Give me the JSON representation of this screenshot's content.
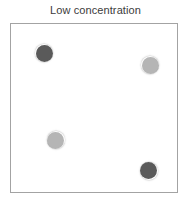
{
  "figure": {
    "title": "Low concentration",
    "background_color": "#ffffff"
  },
  "box": {
    "label": "particle-container",
    "border_color": "#a3a3a3",
    "fill_color": "#ffffff",
    "x": 10,
    "y": 23,
    "width": 168,
    "height": 170
  },
  "legend_colors": {
    "dark_particle": "#5a5a5a",
    "light_particle": "#b5b5b5"
  },
  "chart_data": {
    "type": "scatter",
    "title": "Low concentration",
    "subtitle": "",
    "xlabel": "",
    "ylabel": "",
    "xlim": [
      0,
      168
    ],
    "ylim": [
      0,
      170
    ],
    "grid": false,
    "legend": "none",
    "particle_count": 4,
    "particle_diameter": 17,
    "series": [
      {
        "name": "dark particle",
        "color": "#5a5a5a",
        "points": [
          {
            "x": 34,
            "y": 30
          },
          {
            "x": 138,
            "y": 148
          }
        ]
      },
      {
        "name": "light particle",
        "color": "#b5b5b5",
        "points": [
          {
            "x": 140,
            "y": 42
          },
          {
            "x": 45,
            "y": 117
          }
        ]
      }
    ],
    "particles": [
      {
        "id": "particle-1",
        "shade": "dark",
        "color": "#5a5a5a",
        "cx": 44.0,
        "cy": 53.0,
        "d": 17
      },
      {
        "id": "particle-2",
        "shade": "light",
        "color": "#b5b5b5",
        "cx": 150.0,
        "cy": 65.0,
        "d": 17
      },
      {
        "id": "particle-3",
        "shade": "light",
        "color": "#b5b5b5",
        "cx": 55.5,
        "cy": 140.0,
        "d": 17
      },
      {
        "id": "particle-4",
        "shade": "dark",
        "color": "#5a5a5a",
        "cx": 148.5,
        "cy": 170.5,
        "d": 17
      }
    ]
  }
}
